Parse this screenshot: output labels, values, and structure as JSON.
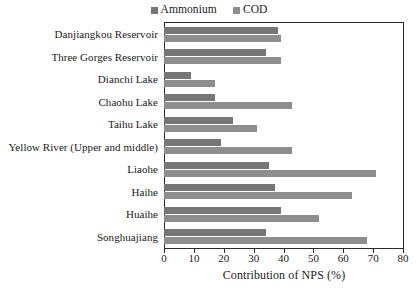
{
  "chart_data": {
    "type": "bar",
    "orientation": "horizontal",
    "title": "",
    "xlabel": "Contribution of NPS (%)",
    "ylabel": "",
    "xlim": [
      0,
      80
    ],
    "xticks": [
      0,
      10,
      20,
      30,
      40,
      50,
      60,
      70,
      80
    ],
    "grid": false,
    "legend_position": "top-center",
    "categories": [
      "Danjiangkou Reservoir",
      "Three Gorges Reservoir",
      "Dianchi Lake",
      "Chaohu Lake",
      "Taihu Lake",
      "Yellow River  (Upper and middle)",
      "Liaohe",
      "Haihe",
      "Huaihe",
      "Songhuajiang"
    ],
    "series": [
      {
        "name": "Ammonium",
        "color": "#767676",
        "values": [
          38,
          34,
          9,
          17,
          23,
          19,
          35,
          37,
          39,
          34
        ]
      },
      {
        "name": "COD",
        "color": "#8e8e8e",
        "values": [
          39,
          39,
          17,
          43,
          31,
          43,
          71,
          63,
          52,
          68
        ]
      }
    ]
  },
  "legend": {
    "entries": [
      {
        "label": "Ammonium",
        "color": "#767676"
      },
      {
        "label": "COD",
        "color": "#8e8e8e"
      }
    ]
  }
}
